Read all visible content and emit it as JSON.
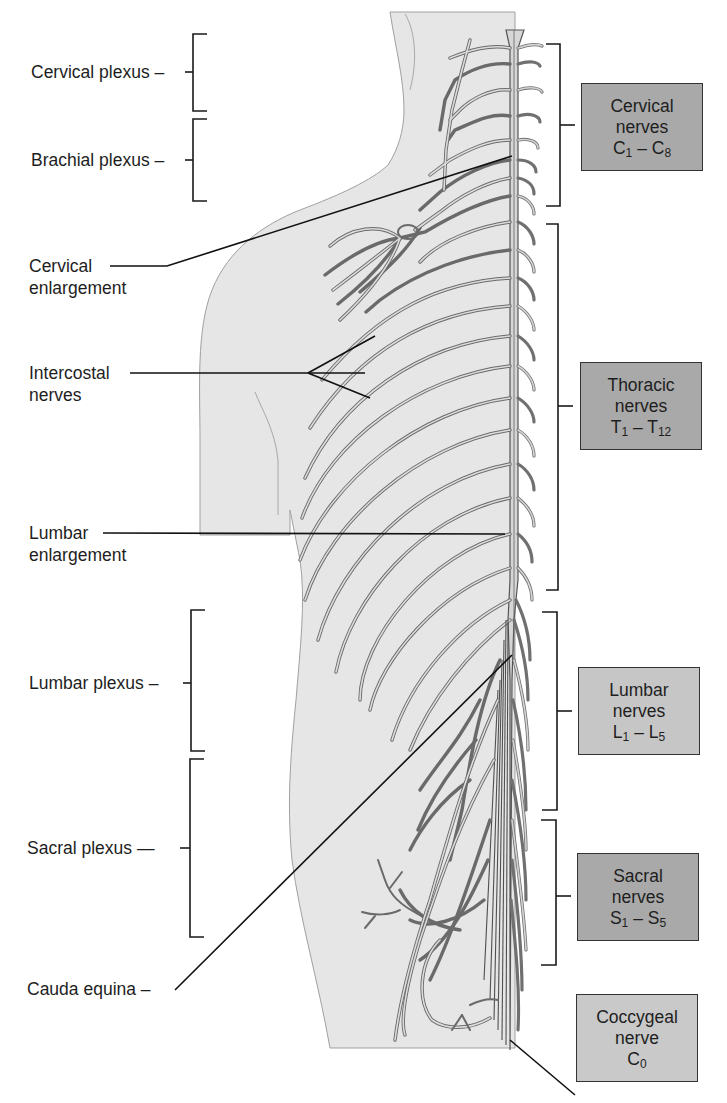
{
  "figure": {
    "colors": {
      "body_fill": "#e6e6e6",
      "body_outline": "#9a9a9a",
      "nerve_stroke": "#6e6e6e",
      "nerve_fill": "#d9d9d9",
      "leader_line": "#111111",
      "box_dark": "#a8a8a8",
      "box_light": "#c8c8c8"
    }
  },
  "left_labels": {
    "cervical_plexus": "Cervical plexus",
    "brachial_plexus": "Brachial plexus",
    "cervical_enlargement": {
      "line1": "Cervical",
      "line2": "enlargement"
    },
    "intercostal_nerves": {
      "line1": "Intercostal",
      "line2": "nerves"
    },
    "lumbar_enlargement": {
      "line1": "Lumbar",
      "line2": "enlargement"
    },
    "lumbar_plexus": "Lumbar plexus",
    "sacral_plexus": "Sacral plexus",
    "cauda_equina": "Cauda equina"
  },
  "right_boxes": {
    "cervical": {
      "line1": "Cervical",
      "line2": "nerves",
      "range_a": "C",
      "sub_a": "1",
      "dash": " – ",
      "range_b": "C",
      "sub_b": "8"
    },
    "thoracic": {
      "line1": "Thoracic",
      "line2": "nerves",
      "range_a": "T",
      "sub_a": "1",
      "dash": " – ",
      "range_b": "T",
      "sub_b": "12"
    },
    "lumbar": {
      "line1": "Lumbar",
      "line2": "nerves",
      "range_a": "L",
      "sub_a": "1",
      "dash": " – ",
      "range_b": "L",
      "sub_b": "5"
    },
    "sacral": {
      "line1": "Sacral",
      "line2": "nerves",
      "range_a": "S",
      "sub_a": "1",
      "dash": " – ",
      "range_b": "S",
      "sub_b": "5"
    },
    "coccygeal": {
      "line1": "Coccygeal",
      "line2": "nerve",
      "range_a": "C",
      "sub_a": "0"
    }
  }
}
